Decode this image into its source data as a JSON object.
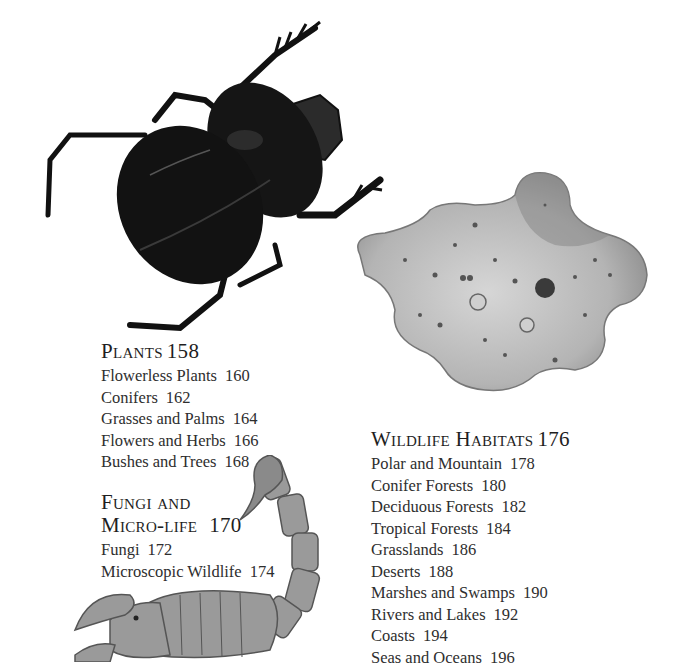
{
  "sections": [
    {
      "title": "Plants",
      "page": "158",
      "items": [
        {
          "label": "Flowerless Plants",
          "page": "160"
        },
        {
          "label": "Conifers",
          "page": "162"
        },
        {
          "label": "Grasses and Palms",
          "page": "164"
        },
        {
          "label": "Flowers and Herbs",
          "page": "166"
        },
        {
          "label": "Bushes and Trees",
          "page": "168"
        }
      ]
    },
    {
      "title_line1": "Fungi and",
      "title_line2": "Micro-life",
      "page": "170",
      "items": [
        {
          "label": "Fungi",
          "page": "172"
        },
        {
          "label": "Microscopic Wildlife",
          "page": "174"
        }
      ]
    },
    {
      "title": "Wildlife Habitats",
      "page": "176",
      "items": [
        {
          "label": "Polar and Mountain",
          "page": "178"
        },
        {
          "label": "Conifer Forests",
          "page": "180"
        },
        {
          "label": "Deciduous Forests",
          "page": "182"
        },
        {
          "label": "Tropical Forests",
          "page": "184"
        },
        {
          "label": "Grasslands",
          "page": "186"
        },
        {
          "label": "Deserts",
          "page": "188"
        },
        {
          "label": "Marshes and Swamps",
          "page": "190"
        },
        {
          "label": "Rivers and Lakes",
          "page": "192"
        },
        {
          "label": "Coasts",
          "page": "194"
        },
        {
          "label": "Seas and Oceans",
          "page": "196"
        }
      ]
    }
  ],
  "illustrations": [
    {
      "subject": "beetle"
    },
    {
      "subject": "amoeba"
    },
    {
      "subject": "scorpion"
    }
  ]
}
